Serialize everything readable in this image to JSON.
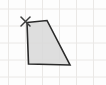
{
  "figure": {
    "background_color": "#fdfdfd",
    "grid": {
      "line_color": "#eae8e6",
      "line_width": 1,
      "vertical_lines_x": [
        8.5,
        25.5,
        42.5,
        59.5,
        76.5,
        93.5
      ],
      "horizontal_lines_y": [
        9,
        26,
        43,
        60,
        77
      ]
    },
    "shape": {
      "type": "quadrilateral",
      "fill_color": "#d8d8d8",
      "fill_opacity": 0.85,
      "stroke_color": "#2a2a2a",
      "stroke_width": 1.6,
      "points": [
        [
          27,
          22.5
        ],
        [
          47,
          20.5
        ],
        [
          70,
          65
        ],
        [
          28.5,
          64
        ]
      ]
    },
    "marker": {
      "type": "x-cross",
      "center_x": 25.5,
      "center_y": 21.5,
      "arm_length": 4.5,
      "color": "#3c3c3c",
      "stroke_width": 1.5
    }
  }
}
